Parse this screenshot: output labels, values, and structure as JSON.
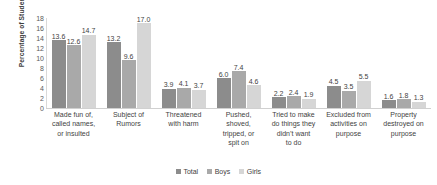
{
  "chart_data": {
    "type": "bar",
    "title": "",
    "subtitle": "",
    "xlabel": "",
    "ylabel": "Percentage of Students Bullied",
    "ylim": [
      0,
      18
    ],
    "ytick_step": 2,
    "yticks": [
      "18",
      "16",
      "14",
      "12",
      "10",
      "8",
      "6",
      "4",
      "2",
      "0"
    ],
    "grid": false,
    "legend_position": "bottom-center",
    "categories": [
      "Made fun of, called names, or insulted",
      "Subject of Rumors",
      "Threatened with harm",
      "Pushed, shoved, tripped, or spit on",
      "Tried to make do things they didn’t want to do",
      "Excluded from activities on purpose",
      "Property destroyed on purpose"
    ],
    "category_lines": [
      [
        "Made fun of,",
        "called names,",
        "or insulted"
      ],
      [
        "Subject of",
        "Rumors"
      ],
      [
        "Threatened",
        "with harm"
      ],
      [
        "Pushed,",
        "shoved,",
        "tripped, or",
        "spit on"
      ],
      [
        "Tried to make",
        "do things they",
        "didn’t want",
        "to do"
      ],
      [
        "Excluded from",
        "activities on",
        "purpose"
      ],
      [
        "Property",
        "destroyed on",
        "purpose"
      ]
    ],
    "series": [
      {
        "name": "Total",
        "color": "#8c8c8c",
        "values": [
          13.6,
          13.2,
          3.9,
          6.0,
          2.2,
          4.5,
          1.6
        ],
        "labels": [
          "13.6",
          "13.2",
          "3.9",
          "6.0",
          "2.2",
          "4.5",
          "1.6"
        ]
      },
      {
        "name": "Boys",
        "color": "#a9a9a9",
        "values": [
          12.6,
          9.6,
          4.1,
          7.4,
          2.4,
          3.5,
          1.8
        ],
        "labels": [
          "12.6",
          "9.6",
          "4.1",
          "7.4",
          "2.4",
          "3.5",
          "1.8"
        ]
      },
      {
        "name": "Girls",
        "color": "#d6d6d6",
        "values": [
          14.7,
          17.0,
          3.7,
          4.6,
          1.9,
          5.5,
          1.3
        ],
        "labels": [
          "14.7",
          "17.0",
          "3.7",
          "4.6",
          "1.9",
          "5.5",
          "1.3"
        ]
      }
    ]
  },
  "legend": {
    "items": [
      {
        "label": "Total",
        "color": "#8c8c8c"
      },
      {
        "label": "Boys",
        "color": "#a9a9a9"
      },
      {
        "label": "Girls",
        "color": "#d6d6d6"
      }
    ]
  },
  "axis": {
    "y_title": "Percentage of Students Bullied",
    "y_max": 18
  }
}
